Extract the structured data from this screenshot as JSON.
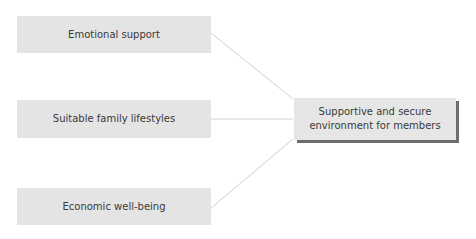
{
  "diagram": {
    "inputs": [
      {
        "label": "Emotional support"
      },
      {
        "label": "Suitable family lifestyles"
      },
      {
        "label": "Economic well-being"
      }
    ],
    "output": {
      "line1": "Supportive and secure",
      "line2": "environment for members"
    },
    "colors": {
      "box_fill": "#e4e4e4",
      "shadow": "#6d6d6d",
      "connector": "#d0d0d0",
      "text": "#3a3a3a"
    }
  }
}
